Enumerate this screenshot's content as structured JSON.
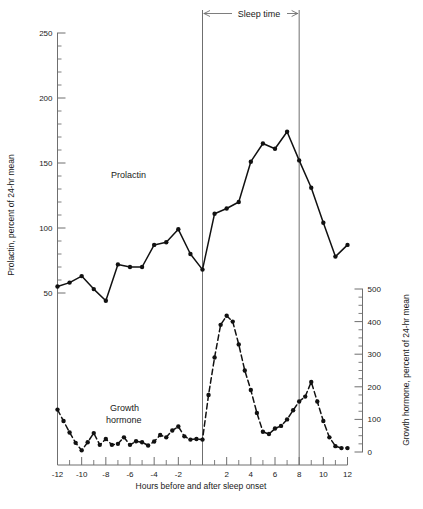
{
  "chart_data": {
    "type": "line",
    "title": "",
    "xlabel": "Hours before and after sleep onset",
    "ylabel": "Prolactin, percent of 24-hr mean",
    "ylabel_right": "Growth hormone, percent of 24-hr mean",
    "xlim": [
      -12,
      12
    ],
    "ylim": [
      0,
      250
    ],
    "ylim_right": [
      0,
      500
    ],
    "grid": false,
    "legend_position": "inline-annotations",
    "x_ticks_major": [
      -12,
      -10,
      -8,
      -6,
      -4,
      -2,
      0,
      2,
      4,
      6,
      8,
      10,
      12
    ],
    "x_tick_labels": [
      "-12",
      "-10",
      "-8",
      "-6",
      "-4",
      "-2",
      "",
      "2",
      "4",
      "6",
      "8",
      "10",
      "12"
    ],
    "x_ticks_minor_step": 1,
    "y_ticks_left": [
      50,
      100,
      150,
      200,
      250
    ],
    "y_tick_labels_left": [
      "50",
      "100",
      "150",
      "200",
      "250"
    ],
    "y_ticks_left_minor_step": 10,
    "y_ticks_right": [
      0,
      100,
      200,
      300,
      400,
      500
    ],
    "y_tick_labels_right": [
      "0",
      "100",
      "200",
      "300",
      "400",
      "500"
    ],
    "y_ticks_right_minor_step": 25,
    "annotations": [
      {
        "name": "sleep-time-bracket",
        "text": "Sleep time",
        "x_start": 0,
        "x_end": 8
      },
      {
        "name": "prolactin-inline-label",
        "text": "Prolactin",
        "x": -6.5,
        "y": 143
      },
      {
        "name": "growth-hormone-inline-label",
        "text": "Growth\nhormone",
        "line1": "Growth",
        "line2": "hormone",
        "x": -6.2,
        "y_right": 150
      }
    ],
    "vertical_lines": [
      0,
      8
    ],
    "series": [
      {
        "name": "Prolactin",
        "axis": "left",
        "style": "solid",
        "marker": "filled-circle",
        "color": "#111111",
        "x": [
          -12,
          -11,
          -10,
          -9,
          -8,
          -7,
          -6,
          -5,
          -4,
          -3,
          -2,
          -1,
          0,
          1,
          2,
          3,
          4,
          5,
          6,
          7,
          8,
          9,
          10,
          11,
          12
        ],
        "values": [
          55,
          58,
          63,
          53,
          44,
          72,
          70,
          70,
          87,
          89,
          99,
          80,
          68,
          111,
          115,
          120,
          151,
          165,
          161,
          174,
          152,
          131,
          104,
          78,
          87
        ]
      },
      {
        "name": "Growth hormone",
        "axis": "right",
        "style": "dashed",
        "marker": "filled-circle",
        "color": "#111111",
        "x": [
          -12,
          -11.5,
          -11,
          -10.5,
          -10,
          -9.5,
          -9,
          -8.5,
          -8,
          -7.5,
          -7,
          -6.5,
          -6,
          -5.5,
          -5,
          -4.5,
          -4,
          -3.5,
          -3,
          -2.5,
          -2,
          -1.5,
          -1,
          -0.5,
          0,
          0.5,
          1,
          1.5,
          2,
          2.5,
          3,
          3.5,
          4,
          4.5,
          5,
          5.5,
          6,
          6.5,
          7,
          7.5,
          8,
          8.5,
          9,
          9.5,
          10,
          10.5,
          11,
          11.5,
          12
        ],
        "values": [
          130,
          95,
          60,
          28,
          5,
          30,
          58,
          22,
          40,
          22,
          25,
          45,
          22,
          33,
          30,
          20,
          32,
          52,
          45,
          66,
          78,
          48,
          38,
          40,
          38,
          175,
          290,
          390,
          418,
          400,
          330,
          250,
          190,
          120,
          62,
          55,
          72,
          80,
          100,
          128,
          155,
          170,
          215,
          155,
          95,
          45,
          18,
          12,
          12
        ]
      }
    ]
  }
}
